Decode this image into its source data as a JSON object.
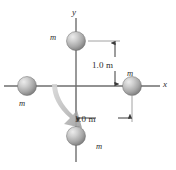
{
  "figure": {
    "type": "physics-diagram",
    "background_color": "#ffffff",
    "axes": {
      "x_label": "x",
      "y_label": "y",
      "origin": {
        "x": 76,
        "y": 86
      },
      "color": "#6e6e6e"
    },
    "masses": [
      {
        "id": "top",
        "label": "m",
        "position": {
          "x": 76,
          "y": 41
        },
        "radius": 9.5,
        "axis": "y",
        "side": "positive"
      },
      {
        "id": "right",
        "label": "m",
        "position": {
          "x": 132,
          "y": 86
        },
        "radius": 9.5,
        "axis": "x",
        "side": "positive"
      },
      {
        "id": "left",
        "label": "m",
        "position": {
          "x": 27,
          "y": 86
        },
        "radius": 9.5,
        "axis": "x",
        "side": "negative"
      },
      {
        "id": "bottom",
        "label": "m",
        "position": {
          "x": 76,
          "y": 136
        },
        "radius": 9.5,
        "axis": "y",
        "side": "negative"
      }
    ],
    "dimensions": [
      {
        "id": "vertical",
        "label": "1.0 m",
        "orientation": "vertical",
        "from": "origin",
        "to": "top mass"
      },
      {
        "id": "horizontal",
        "label": "1.0 m",
        "orientation": "horizontal",
        "from": "origin",
        "to": "right mass"
      }
    ],
    "arrow": {
      "id": "rotation-arrow",
      "style": "curved",
      "color": "#b5b5b5",
      "direction": "clockwise"
    },
    "sphere_colors": {
      "highlight": "#e8e8e8",
      "midtone": "#b0b0b0",
      "shadow": "#7c7c7c",
      "edge": "#6a6a6a"
    }
  }
}
